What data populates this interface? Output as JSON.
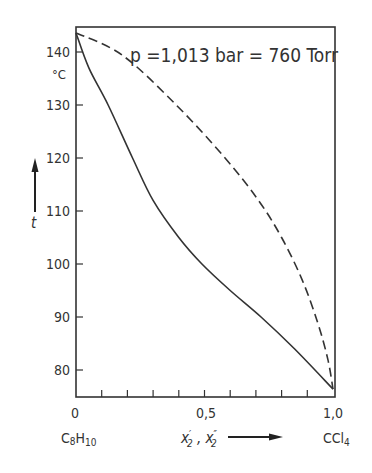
{
  "chart_data": {
    "type": "line",
    "xlabel": "x'2 , x''2",
    "ylabel": "t",
    "y_unit": "°C",
    "xlim": [
      0,
      1
    ],
    "ylim": [
      76,
      144
    ],
    "x_ticks": [
      0,
      0.1,
      0.2,
      0.3,
      0.4,
      0.5,
      0.6,
      0.7,
      0.8,
      0.9,
      1.0
    ],
    "x_tick_labels": [
      "0",
      "0,5",
      "1,0"
    ],
    "y_ticks": [
      80,
      90,
      100,
      110,
      120,
      130,
      140
    ],
    "y_tick_labels": [
      "80",
      "90",
      "100",
      "110",
      "120",
      "130",
      "140"
    ],
    "x_end_labels": {
      "left": "C8H10",
      "right": "CCl4"
    },
    "grid": false,
    "series": [
      {
        "name": "liquid (boiling curve)",
        "style": "solid",
        "x": [
          0,
          0.05,
          0.125,
          0.22,
          0.3,
          0.4,
          0.49,
          0.6,
          0.72,
          0.85,
          1.0
        ],
        "y": [
          143.6,
          137,
          130,
          120,
          112,
          105,
          100,
          95,
          90,
          84,
          76.4
        ]
      },
      {
        "name": "vapor (dew curve)",
        "style": "dashed",
        "x": [
          0,
          0.18,
          0.39,
          0.58,
          0.71,
          0.8,
          0.88,
          0.94,
          0.98,
          1.0
        ],
        "y": [
          143.6,
          139.4,
          130,
          120,
          112,
          105,
          97,
          89,
          82,
          76.4
        ]
      }
    ]
  },
  "labels": {
    "pressure": "p =1,013 bar = 760 Torr",
    "y_unit": "°C",
    "y_axis": "t",
    "x_axis": "x′2 , x″2",
    "left_component": "C8H10",
    "right_component": "CCl4",
    "x0": "0",
    "x05": "0,5",
    "x1": "1,0"
  }
}
